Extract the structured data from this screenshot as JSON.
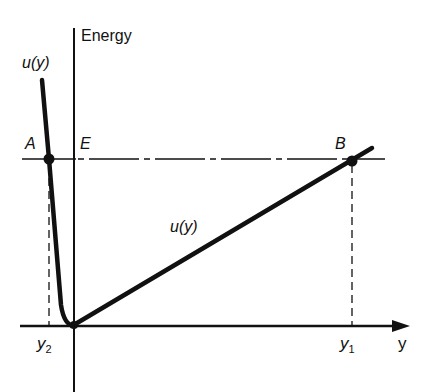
{
  "diagram": {
    "axes": {
      "y_axis_label": "Energy",
      "x_axis_label": "y"
    },
    "curve_labels": {
      "left_curve": "u(y)",
      "right_curve": "u(y)"
    },
    "points": {
      "A": "A",
      "B": "B",
      "E": "E"
    },
    "ticks": {
      "y2": {
        "base": "y",
        "sub": "2"
      },
      "y1": {
        "base": "y",
        "sub": "1"
      }
    },
    "colors": {
      "ink": "#111111",
      "background": "#ffffff"
    }
  }
}
